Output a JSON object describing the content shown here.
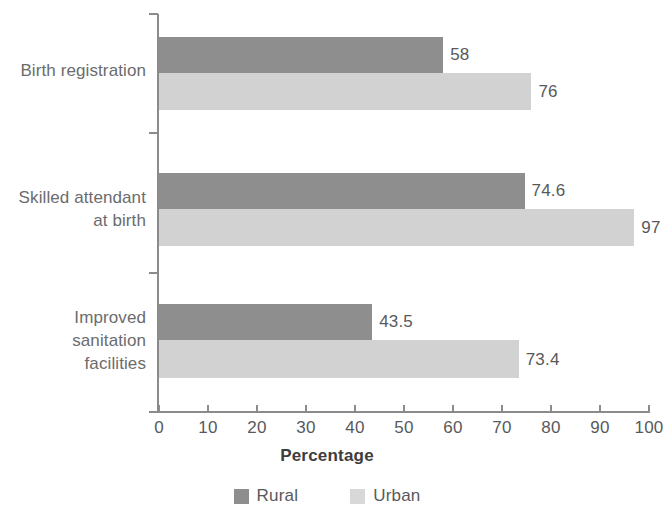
{
  "chart_data": {
    "type": "bar",
    "orientation": "horizontal",
    "title": "",
    "xlabel": "Percentage",
    "ylabel": "",
    "xlim": [
      0,
      100
    ],
    "xticks": [
      0,
      10,
      20,
      30,
      40,
      50,
      60,
      70,
      80,
      90,
      100
    ],
    "xtick_labels": [
      "0",
      "10",
      "20",
      "30",
      "40",
      "50",
      "60",
      "70",
      "80",
      "90",
      "100"
    ],
    "grid": false,
    "legend_position": "bottom",
    "categories": [
      "Birth registration",
      "Skilled attendant at birth",
      "Improved sanitation facilities"
    ],
    "category_label_lines": [
      [
        "Birth registration"
      ],
      [
        "Skilled attendant",
        "at birth"
      ],
      [
        "Improved",
        "sanitation",
        "facilities"
      ]
    ],
    "series": [
      {
        "name": "Rural",
        "color": "#8e8e8e",
        "values": [
          58,
          74.6,
          43.5
        ],
        "value_labels": [
          "58",
          "74.6",
          "43.5"
        ]
      },
      {
        "name": "Urban",
        "color": "#d2d2d2",
        "values": [
          76,
          97,
          73.4
        ],
        "value_labels": [
          "76",
          "97",
          "73.4"
        ]
      }
    ]
  },
  "legend": {
    "items": [
      {
        "label": "Rural",
        "color": "#8e8e8e"
      },
      {
        "label": "Urban",
        "color": "#d8d8d8"
      }
    ]
  }
}
